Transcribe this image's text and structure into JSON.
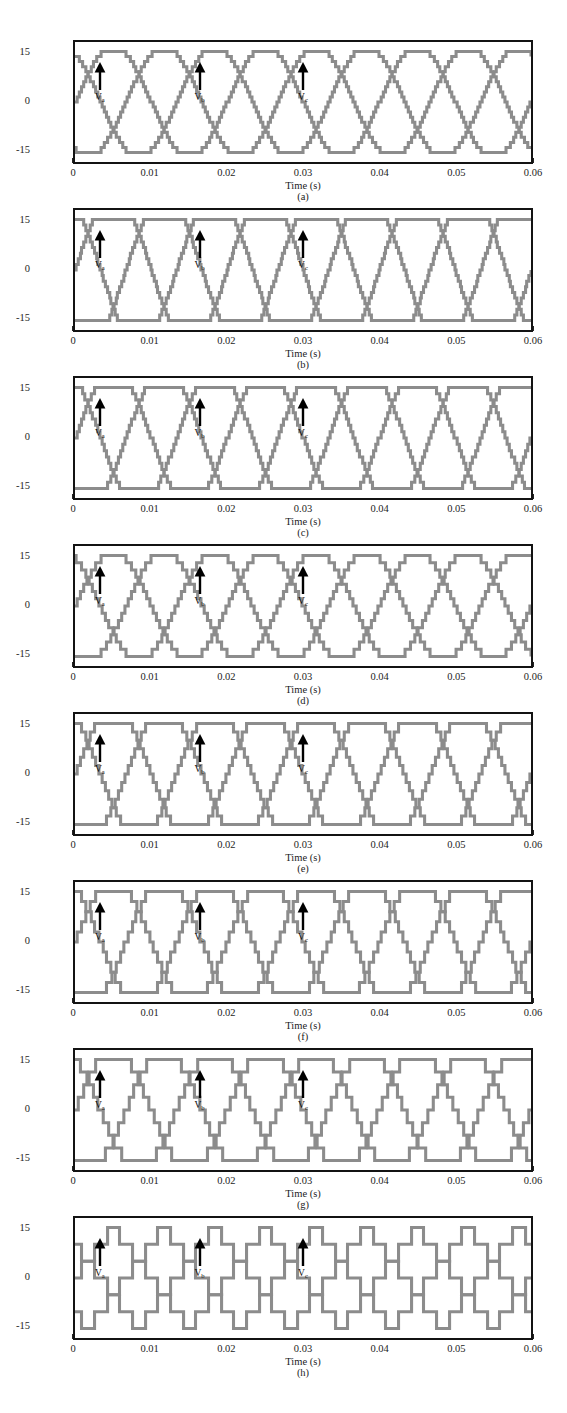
{
  "figure": {
    "panel_count": 8,
    "waveform_color": "#8c8c8c",
    "frame_color": "#131313",
    "background": "#ffffff"
  },
  "axes": {
    "xlabel": "Time (s)",
    "ylabel": "Voltage (kV)",
    "xticks": [
      "0",
      "0.01",
      "0.02",
      "0.03",
      "0.04",
      "0.05",
      "0.06"
    ],
    "xtick_values": [
      0,
      0.01,
      0.02,
      0.03,
      0.04,
      0.05,
      0.06
    ],
    "yticks": [
      "15",
      "0",
      "-15"
    ],
    "ytick_values": [
      15,
      0,
      -15
    ],
    "xlim": [
      0,
      0.06
    ],
    "ylim": [
      -19,
      19
    ]
  },
  "annotations": {
    "phase_a": "V",
    "phase_a_sub": "a",
    "phase_b": "V",
    "phase_b_sub": "b",
    "phase_c": "V",
    "phase_c_sub": "c",
    "phase_a_time": 0.0035,
    "phase_b_time": 0.0165,
    "phase_c_time": 0.03
  },
  "captions": {
    "a": "(a)",
    "b": "(b)",
    "c": "(c)",
    "d": "(d)",
    "e": "(e)",
    "f": "(f)",
    "g": "(g)",
    "h": "(h)"
  },
  "chart_data": [
    {
      "id": "a",
      "type": "line",
      "title": "(a)",
      "xlabel": "Time (s)",
      "ylabel": "Voltage (kV)",
      "xlim": [
        0,
        0.06
      ],
      "ylim": [
        -19,
        19
      ],
      "grid": false,
      "legend": [
        "Va",
        "Vb",
        "Vc"
      ],
      "frequency_hz": 50,
      "amplitude_kv": 16,
      "waveshape": "near-sinusoidal",
      "flat_fraction": 0.06,
      "step_levels": 21,
      "series": [
        {
          "name": "Va",
          "phase_deg": 0,
          "peak": 16,
          "trough": -16
        },
        {
          "name": "Vb",
          "phase_deg": -120,
          "peak": 16,
          "trough": -16
        },
        {
          "name": "Vc",
          "phase_deg": 120,
          "peak": 16,
          "trough": -16
        }
      ]
    },
    {
      "id": "b",
      "type": "line",
      "title": "(b)",
      "xlabel": "Time (s)",
      "ylabel": "Voltage (kV)",
      "xlim": [
        0,
        0.06
      ],
      "ylim": [
        -19,
        19
      ],
      "grid": false,
      "legend": [
        "Va",
        "Vb",
        "Vc"
      ],
      "frequency_hz": 50,
      "amplitude_kv": 16,
      "waveshape": "trapezoidal-flat-top",
      "flat_fraction": 0.22,
      "step_levels": 19,
      "series": [
        {
          "name": "Va",
          "phase_deg": 0,
          "peak": 16,
          "trough": -16
        },
        {
          "name": "Vb",
          "phase_deg": -120,
          "peak": 16,
          "trough": -16
        },
        {
          "name": "Vc",
          "phase_deg": 120,
          "peak": 16,
          "trough": -16
        }
      ]
    },
    {
      "id": "c",
      "type": "line",
      "title": "(c)",
      "xlabel": "Time (s)",
      "ylabel": "Voltage (kV)",
      "xlim": [
        0,
        0.06
      ],
      "ylim": [
        -19,
        19
      ],
      "grid": false,
      "legend": [
        "Va",
        "Vb",
        "Vc"
      ],
      "frequency_hz": 50,
      "amplitude_kv": 16,
      "waveshape": "trapezoidal",
      "flat_fraction": 0.18,
      "step_levels": 17,
      "series": [
        {
          "name": "Va",
          "phase_deg": 0,
          "peak": 16,
          "trough": -16
        },
        {
          "name": "Vb",
          "phase_deg": -120,
          "peak": 16,
          "trough": -16
        },
        {
          "name": "Vc",
          "phase_deg": 120,
          "peak": 16,
          "trough": -16
        }
      ]
    },
    {
      "id": "d",
      "type": "line",
      "title": "(d)",
      "xlabel": "Time (s)",
      "ylabel": "Voltage (kV)",
      "xlim": [
        0,
        0.06
      ],
      "ylim": [
        -19,
        19
      ],
      "grid": false,
      "legend": [
        "Va",
        "Vb",
        "Vc"
      ],
      "frequency_hz": 50,
      "amplitude_kv": 16,
      "waveshape": "near-sinusoidal",
      "flat_fraction": 0.05,
      "step_levels": 15,
      "series": [
        {
          "name": "Va",
          "phase_deg": 0,
          "peak": 16,
          "trough": -16
        },
        {
          "name": "Vb",
          "phase_deg": -120,
          "peak": 16,
          "trough": -16
        },
        {
          "name": "Vc",
          "phase_deg": 120,
          "peak": 16,
          "trough": -16
        }
      ]
    },
    {
      "id": "e",
      "type": "line",
      "title": "(e)",
      "xlabel": "Time (s)",
      "ylabel": "Voltage (kV)",
      "xlim": [
        0,
        0.06
      ],
      "ylim": [
        -19,
        19
      ],
      "grid": false,
      "legend": [
        "Va",
        "Vb",
        "Vc"
      ],
      "frequency_hz": 50,
      "amplitude_kv": 16,
      "waveshape": "trapezoidal",
      "flat_fraction": 0.15,
      "step_levels": 13,
      "series": [
        {
          "name": "Va",
          "phase_deg": 0,
          "peak": 16,
          "trough": -16
        },
        {
          "name": "Vb",
          "phase_deg": -120,
          "peak": 16,
          "trough": -16
        },
        {
          "name": "Vc",
          "phase_deg": 120,
          "peak": 16,
          "trough": -16
        }
      ]
    },
    {
      "id": "f",
      "type": "line",
      "title": "(f)",
      "xlabel": "Time (s)",
      "ylabel": "Voltage (kV)",
      "xlim": [
        0,
        0.06
      ],
      "ylim": [
        -19,
        19
      ],
      "grid": false,
      "legend": [
        "Va",
        "Vb",
        "Vc"
      ],
      "frequency_hz": 50,
      "amplitude_kv": 16,
      "waveshape": "trapezoidal",
      "flat_fraction": 0.13,
      "step_levels": 11,
      "series": [
        {
          "name": "Va",
          "phase_deg": 0,
          "peak": 16,
          "trough": -16
        },
        {
          "name": "Vb",
          "phase_deg": -120,
          "peak": 16,
          "trough": -16
        },
        {
          "name": "Vc",
          "phase_deg": 120,
          "peak": 16,
          "trough": -16
        }
      ]
    },
    {
      "id": "g",
      "type": "line",
      "title": "(g)",
      "xlabel": "Time (s)",
      "ylabel": "Voltage (kV)",
      "xlim": [
        0,
        0.06
      ],
      "ylim": [
        -19,
        19
      ],
      "grid": false,
      "legend": [
        "Va",
        "Vb",
        "Vc"
      ],
      "frequency_hz": 50,
      "amplitude_kv": 16,
      "waveshape": "trapezoidal-narrow-flat",
      "flat_fraction": 0.1,
      "step_levels": 9,
      "series": [
        {
          "name": "Va",
          "phase_deg": 0,
          "peak": 16,
          "trough": -16
        },
        {
          "name": "Vb",
          "phase_deg": -120,
          "peak": 16,
          "trough": -16
        },
        {
          "name": "Vc",
          "phase_deg": 120,
          "peak": 16,
          "trough": -16
        }
      ]
    },
    {
      "id": "h",
      "type": "line",
      "title": "(h)",
      "xlabel": "Time (s)",
      "ylabel": "Voltage (kV)",
      "xlim": [
        0,
        0.06
      ],
      "ylim": [
        -19,
        19
      ],
      "grid": false,
      "legend": [
        "Va",
        "Vb",
        "Vc"
      ],
      "frequency_hz": 50,
      "amplitude_kv": 16,
      "waveshape": "triangular",
      "flat_fraction": 0.03,
      "step_levels": 7,
      "series": [
        {
          "name": "Va",
          "phase_deg": 0,
          "peak": 16,
          "trough": -16
        },
        {
          "name": "Vb",
          "phase_deg": -120,
          "peak": 16,
          "trough": -16
        },
        {
          "name": "Vc",
          "phase_deg": 120,
          "peak": 16,
          "trough": -16
        }
      ]
    }
  ]
}
